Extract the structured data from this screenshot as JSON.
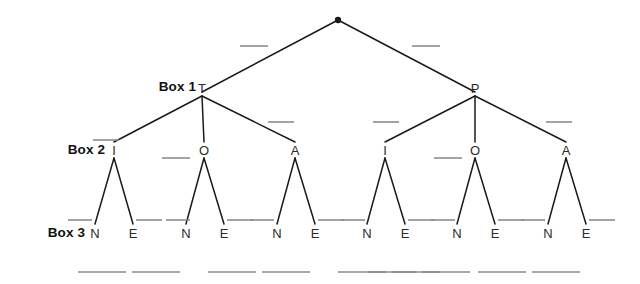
{
  "diagram": {
    "type": "tree-diagram",
    "title": "",
    "background_color": "#ffffff",
    "line_color": "#1a1a1a",
    "blank_color": "#8c8c8c",
    "label_color": "#121212"
  },
  "row_labels": [
    {
      "id": "box-1",
      "text": "Box 1",
      "x": 196,
      "y": 87
    },
    {
      "id": "box-2",
      "text": "Box 2",
      "x": 105,
      "y": 150
    },
    {
      "id": "box-3",
      "text": "Box 3",
      "x": 85,
      "y": 233
    }
  ],
  "root": {
    "id": "root-node",
    "shape": "dot",
    "x": 338,
    "y": 20,
    "radius": 3.2,
    "label": ""
  },
  "nodes": [
    {
      "id": "node-t",
      "label": "T",
      "x": 202,
      "y": 88,
      "level": 1
    },
    {
      "id": "node-p",
      "label": "P",
      "x": 475,
      "y": 88,
      "level": 1
    },
    {
      "id": "node-l-i",
      "label": "I",
      "x": 114,
      "y": 150,
      "level": 2
    },
    {
      "id": "node-l-o",
      "label": "O",
      "x": 204,
      "y": 150,
      "level": 2
    },
    {
      "id": "node-l-a",
      "label": "A",
      "x": 295,
      "y": 150,
      "level": 2
    },
    {
      "id": "node-r-i",
      "label": "I",
      "x": 385,
      "y": 150,
      "level": 2
    },
    {
      "id": "node-r-o",
      "label": "O",
      "x": 475,
      "y": 150,
      "level": 2
    },
    {
      "id": "node-r-a",
      "label": "A",
      "x": 566,
      "y": 150,
      "level": 2
    },
    {
      "id": "leaf-1-n",
      "label": "N",
      "x": 95,
      "y": 233,
      "level": 3
    },
    {
      "id": "leaf-1-e",
      "label": "E",
      "x": 133,
      "y": 233,
      "level": 3
    },
    {
      "id": "leaf-2-n",
      "label": "N",
      "x": 186,
      "y": 233,
      "level": 3
    },
    {
      "id": "leaf-2-e",
      "label": "E",
      "x": 224,
      "y": 233,
      "level": 3
    },
    {
      "id": "leaf-3-n",
      "label": "N",
      "x": 277,
      "y": 233,
      "level": 3
    },
    {
      "id": "leaf-3-e",
      "label": "E",
      "x": 315,
      "y": 233,
      "level": 3
    },
    {
      "id": "leaf-4-n",
      "label": "N",
      "x": 367,
      "y": 233,
      "level": 3
    },
    {
      "id": "leaf-4-e",
      "label": "E",
      "x": 405,
      "y": 233,
      "level": 3
    },
    {
      "id": "leaf-5-n",
      "label": "N",
      "x": 457,
      "y": 233,
      "level": 3
    },
    {
      "id": "leaf-5-e",
      "label": "E",
      "x": 495,
      "y": 233,
      "level": 3
    },
    {
      "id": "leaf-6-n",
      "label": "N",
      "x": 548,
      "y": 233,
      "level": 3
    },
    {
      "id": "leaf-6-e",
      "label": "E",
      "x": 586,
      "y": 233,
      "level": 3
    }
  ],
  "edges": [
    {
      "id": "edge-root-t",
      "x1": 338,
      "y1": 20,
      "x2": 202,
      "y2": 92
    },
    {
      "id": "edge-root-p",
      "x1": 338,
      "y1": 20,
      "x2": 475,
      "y2": 92
    },
    {
      "id": "edge-t-i",
      "x1": 202,
      "y1": 96,
      "x2": 114,
      "y2": 142
    },
    {
      "id": "edge-t-o",
      "x1": 202,
      "y1": 96,
      "x2": 204,
      "y2": 142
    },
    {
      "id": "edge-t-a",
      "x1": 202,
      "y1": 96,
      "x2": 295,
      "y2": 142
    },
    {
      "id": "edge-p-i",
      "x1": 475,
      "y1": 96,
      "x2": 385,
      "y2": 142
    },
    {
      "id": "edge-p-o",
      "x1": 475,
      "y1": 96,
      "x2": 475,
      "y2": 142
    },
    {
      "id": "edge-p-a",
      "x1": 475,
      "y1": 96,
      "x2": 566,
      "y2": 142
    },
    {
      "id": "edge-li-n",
      "x1": 114,
      "y1": 158,
      "x2": 95,
      "y2": 224
    },
    {
      "id": "edge-li-e",
      "x1": 114,
      "y1": 158,
      "x2": 133,
      "y2": 224
    },
    {
      "id": "edge-lo-n",
      "x1": 204,
      "y1": 158,
      "x2": 186,
      "y2": 224
    },
    {
      "id": "edge-lo-e",
      "x1": 204,
      "y1": 158,
      "x2": 224,
      "y2": 224
    },
    {
      "id": "edge-la-n",
      "x1": 295,
      "y1": 158,
      "x2": 277,
      "y2": 224
    },
    {
      "id": "edge-la-e",
      "x1": 295,
      "y1": 158,
      "x2": 315,
      "y2": 224
    },
    {
      "id": "edge-ri-n",
      "x1": 385,
      "y1": 158,
      "x2": 367,
      "y2": 224
    },
    {
      "id": "edge-ri-e",
      "x1": 385,
      "y1": 158,
      "x2": 405,
      "y2": 224
    },
    {
      "id": "edge-ro-n",
      "x1": 475,
      "y1": 158,
      "x2": 457,
      "y2": 224
    },
    {
      "id": "edge-ro-e",
      "x1": 475,
      "y1": 158,
      "x2": 495,
      "y2": 224
    },
    {
      "id": "edge-ra-n",
      "x1": 566,
      "y1": 158,
      "x2": 548,
      "y2": 224
    },
    {
      "id": "edge-ra-e",
      "x1": 566,
      "y1": 158,
      "x2": 586,
      "y2": 224
    }
  ],
  "blanks": [
    {
      "id": "blank-root-left",
      "x1": 240,
      "y1": 46,
      "x2": 268,
      "y2": 46,
      "value": ""
    },
    {
      "id": "blank-root-right",
      "x1": 412,
      "y1": 46,
      "x2": 440,
      "y2": 46,
      "value": ""
    },
    {
      "id": "blank-t-left",
      "x1": 93,
      "y1": 140,
      "x2": 119,
      "y2": 140,
      "value": ""
    },
    {
      "id": "blank-t-right",
      "x1": 268,
      "y1": 122,
      "x2": 294,
      "y2": 122,
      "value": ""
    },
    {
      "id": "blank-p-left",
      "x1": 373,
      "y1": 122,
      "x2": 399,
      "y2": 122,
      "value": ""
    },
    {
      "id": "blank-p-right",
      "x1": 546,
      "y1": 122,
      "x2": 572,
      "y2": 122,
      "value": ""
    },
    {
      "id": "blank-lo-left",
      "x1": 162,
      "y1": 158,
      "x2": 190,
      "y2": 158,
      "value": ""
    },
    {
      "id": "blank-ro-left",
      "x1": 434,
      "y1": 158,
      "x2": 462,
      "y2": 158,
      "value": ""
    },
    {
      "id": "blank-leaf-1a",
      "x1": 68,
      "y1": 220,
      "x2": 92,
      "y2": 220,
      "value": ""
    },
    {
      "id": "blank-leaf-1b",
      "x1": 136,
      "y1": 220,
      "x2": 162,
      "y2": 220,
      "value": ""
    },
    {
      "id": "blank-leaf-2a",
      "x1": 166,
      "y1": 220,
      "x2": 190,
      "y2": 220,
      "value": ""
    },
    {
      "id": "blank-leaf-2b",
      "x1": 227,
      "y1": 220,
      "x2": 253,
      "y2": 220,
      "value": ""
    },
    {
      "id": "blank-leaf-3a",
      "x1": 250,
      "y1": 220,
      "x2": 274,
      "y2": 220,
      "value": ""
    },
    {
      "id": "blank-leaf-3b",
      "x1": 318,
      "y1": 220,
      "x2": 344,
      "y2": 220,
      "value": ""
    },
    {
      "id": "blank-leaf-4a",
      "x1": 341,
      "y1": 220,
      "x2": 365,
      "y2": 220,
      "value": ""
    },
    {
      "id": "blank-leaf-4b",
      "x1": 408,
      "y1": 220,
      "x2": 434,
      "y2": 220,
      "value": ""
    },
    {
      "id": "blank-leaf-5a",
      "x1": 431,
      "y1": 220,
      "x2": 455,
      "y2": 220,
      "value": ""
    },
    {
      "id": "blank-leaf-5b",
      "x1": 498,
      "y1": 220,
      "x2": 524,
      "y2": 220,
      "value": ""
    },
    {
      "id": "blank-leaf-6a",
      "x1": 521,
      "y1": 220,
      "x2": 545,
      "y2": 220,
      "value": ""
    },
    {
      "id": "blank-leaf-6b",
      "x1": 589,
      "y1": 220,
      "x2": 615,
      "y2": 220,
      "value": ""
    }
  ],
  "answer_blanks": [
    {
      "id": "answer-blank-1",
      "x1": 78,
      "y1": 272,
      "x2": 126,
      "y2": 272,
      "value": ""
    },
    {
      "id": "answer-blank-2",
      "x1": 132,
      "y1": 272,
      "x2": 180,
      "y2": 272,
      "value": ""
    },
    {
      "id": "answer-blank-3",
      "x1": 208,
      "y1": 272,
      "x2": 256,
      "y2": 272,
      "value": ""
    },
    {
      "id": "answer-blank-4",
      "x1": 262,
      "y1": 272,
      "x2": 310,
      "y2": 272,
      "value": ""
    },
    {
      "id": "answer-blank-5",
      "x1": 338,
      "y1": 272,
      "x2": 386,
      "y2": 272,
      "value": ""
    },
    {
      "id": "answer-blank-6",
      "x1": 392,
      "y1": 272,
      "x2": 440,
      "y2": 272,
      "value": ""
    },
    {
      "id": "answer-blank-7",
      "x1": 368,
      "y1": 272,
      "x2": 416,
      "y2": 272,
      "value": ""
    },
    {
      "id": "answer-blank-8",
      "x1": 422,
      "y1": 272,
      "x2": 470,
      "y2": 272,
      "value": ""
    },
    {
      "id": "answer-blank-9",
      "x1": 478,
      "y1": 272,
      "x2": 526,
      "y2": 272,
      "value": ""
    },
    {
      "id": "answer-blank-10",
      "x1": 532,
      "y1": 272,
      "x2": 580,
      "y2": 272,
      "value": ""
    }
  ]
}
